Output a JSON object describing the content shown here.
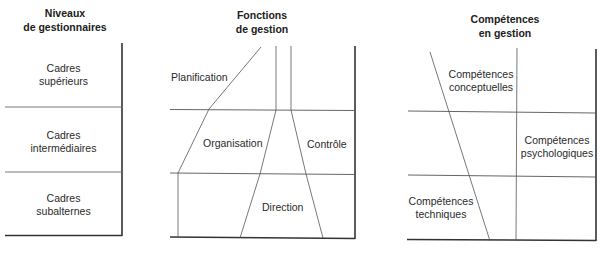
{
  "panels": {
    "levels": {
      "title_line1": "Niveaux",
      "title_line2": "de gestionnaires",
      "rows": [
        {
          "line1": "Cadres",
          "line2": "supérieurs"
        },
        {
          "line1": "Cadres",
          "line2": "intermédiaires"
        },
        {
          "line1": "Cadres",
          "line2": "subalternes"
        }
      ]
    },
    "functions": {
      "title_line1": "Fonctions",
      "title_line2": "de gestion",
      "regions": {
        "planning": "Planification",
        "organizing": "Organisation",
        "controlling": "Contrôle",
        "directing": "Direction"
      }
    },
    "skills": {
      "title_line1": "Compétences",
      "title_line2": "en gestion",
      "regions": {
        "conceptual": {
          "line1": "Compétences",
          "line2": "conceptuelles"
        },
        "psychological": {
          "line1": "Compétences",
          "line2": "psychologiques"
        },
        "technical": {
          "line1": "Compétences",
          "line2": "techniques"
        }
      }
    }
  },
  "colors": {
    "line": "#2a2a2a",
    "thin_line": "#555555",
    "text": "#2a2a2a"
  }
}
